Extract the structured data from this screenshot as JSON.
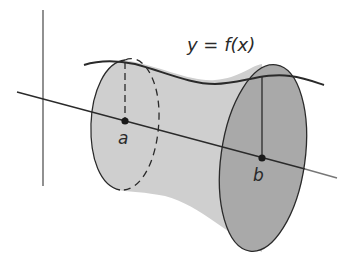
{
  "diagram": {
    "function_label": "y = f(x)",
    "points": [
      {
        "id": "a",
        "label": "a"
      },
      {
        "id": "b",
        "label": "b"
      }
    ],
    "colors": {
      "line": "#2a2a2a",
      "axis": "#555555",
      "surface_fill": "#cfcfcf",
      "end_face_fill": "#a9a9a9",
      "background": "#ffffff"
    }
  }
}
